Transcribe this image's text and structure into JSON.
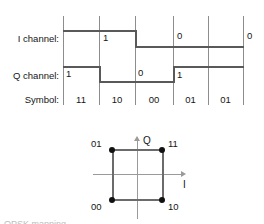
{
  "figure": {
    "timing": {
      "row_labels": {
        "i_channel": "I channel:",
        "q_channel": "Q channel:",
        "symbol": "Symbol:"
      },
      "symbols": [
        "11",
        "10",
        "00",
        "01",
        "01"
      ],
      "i_channel": {
        "values": [
          "1",
          "0",
          "0"
        ],
        "levels": [
          1,
          1,
          0,
          0,
          0
        ]
      },
      "q_channel": {
        "values": [
          "1",
          "0",
          "1"
        ],
        "levels": [
          1,
          0,
          0,
          1,
          1
        ]
      }
    },
    "constellation": {
      "axis_labels": {
        "i": "I",
        "q": "Q"
      },
      "points": [
        {
          "label": "01",
          "i": -1,
          "q": 1
        },
        {
          "label": "11",
          "i": 1,
          "q": 1
        },
        {
          "label": "00",
          "i": -1,
          "q": -1
        },
        {
          "label": "10",
          "i": 1,
          "q": -1
        }
      ]
    },
    "caption_fragment": "QPSK mapping"
  },
  "colors": {
    "gridline": "#8d8d8d",
    "waveform": "#595959",
    "constellation_axis": "#9a9a9a",
    "constellation_side": "#6b6b6b",
    "point": "#111111",
    "text": "#151515",
    "background": "#ffffff"
  }
}
